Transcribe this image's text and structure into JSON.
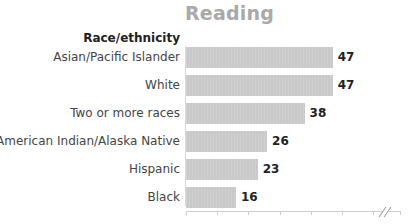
{
  "chart_data": {
    "type": "bar",
    "orientation": "horizontal",
    "title": "Reading",
    "category_header": "Race/ethnicity",
    "categories": [
      "Asian/Pacific Islander",
      "White",
      "Two or more races",
      "American Indian/Alaska Native",
      "Hispanic",
      "Black"
    ],
    "values": [
      47,
      47,
      38,
      26,
      23,
      16
    ],
    "value_labels": [
      "47",
      "47",
      "38",
      "26",
      "23",
      "16"
    ],
    "xlabel": "",
    "ylabel": "",
    "xlim": [
      0,
      70
    ],
    "axis_break": true,
    "grid": false,
    "legend": null,
    "bar_color": "#c9c9c9"
  }
}
